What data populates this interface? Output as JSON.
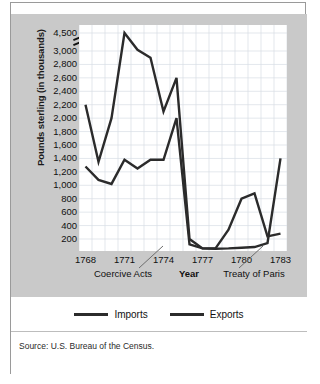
{
  "card": {
    "faint_top_text": "",
    "source": "Source: U.S. Bureau of the Census."
  },
  "legend": {
    "items": [
      {
        "label": "Imports",
        "color": "#2b2b2b"
      },
      {
        "label": "Exports",
        "color": "#2b2b2b"
      }
    ]
  },
  "chart_data": {
    "type": "line",
    "title": "",
    "xlabel": "Year",
    "ylabel": "Pounds sterling (in thousands)",
    "grid": true,
    "legend_position": "bottom",
    "axis_break": {
      "present": true,
      "between": [
        3000,
        4500
      ],
      "note": "y-axis compressed between 3,000 and 4,500"
    },
    "x": [
      1768,
      1769,
      1770,
      1771,
      1772,
      1773,
      1774,
      1775,
      1776,
      1777,
      1778,
      1779,
      1780,
      1781,
      1782,
      1783
    ],
    "xtick_labels": [
      "1768",
      "1771",
      "1774",
      "1777",
      "1780",
      "1783"
    ],
    "xtick_values": [
      1768,
      1771,
      1774,
      1777,
      1780,
      1783
    ],
    "ytick_labels": [
      "200",
      "400",
      "600",
      "800",
      "1,000",
      "1,200",
      "1,400",
      "1,600",
      "1,800",
      "2,000",
      "2,200",
      "2,400",
      "2,600",
      "2,800",
      "3,000",
      "4,500"
    ],
    "ytick_values": [
      200,
      400,
      600,
      800,
      1000,
      1200,
      1400,
      1600,
      1800,
      2000,
      2200,
      2400,
      2600,
      2800,
      3000,
      4500
    ],
    "ylim": [
      0,
      4500
    ],
    "xlim": [
      1768,
      1783
    ],
    "series": [
      {
        "name": "Imports",
        "color": "#2b2b2b",
        "values": [
          2200,
          1350,
          2000,
          4500,
          3100,
          2900,
          2100,
          2600,
          200,
          60,
          55,
          60,
          70,
          80,
          140,
          1400
        ]
      },
      {
        "name": "Exports",
        "color": "#2b2b2b",
        "values": [
          1280,
          1080,
          1020,
          1380,
          1250,
          1380,
          1380,
          2000,
          120,
          60,
          60,
          340,
          800,
          880,
          240,
          280
        ]
      }
    ],
    "annotations": [
      {
        "label": "Coercive Acts",
        "points_to_year": 1774,
        "points_to_value": 200
      },
      {
        "label": "Treaty of Paris",
        "points_to_year": 1783,
        "points_to_value": 200
      }
    ]
  }
}
